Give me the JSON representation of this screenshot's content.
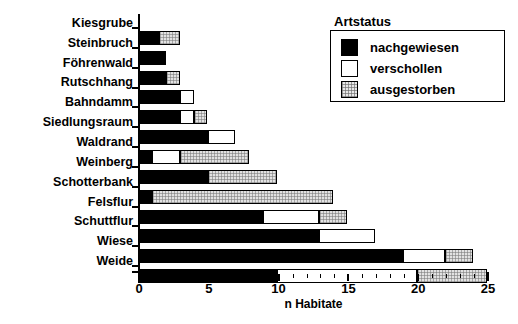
{
  "chart_data": {
    "type": "bar",
    "orientation": "horizontal",
    "stacked": true,
    "title": "",
    "xlabel": "n Habitate",
    "ylabel": "",
    "xlim": [
      0,
      25
    ],
    "xticks": [
      0,
      5,
      10,
      15,
      20,
      25
    ],
    "xticklabels": [
      "0",
      "5",
      "10",
      "15",
      "20",
      "25"
    ],
    "minor_tick_step": 1,
    "grid": false,
    "categories": [
      "Kiesgrube",
      "Steinbruch",
      "Föhrenwald",
      "Rutschhang",
      "Bahndamm",
      "Siedlungsraum",
      "Waldrand",
      "Weinberg",
      "Schotterbank",
      "Felsflur",
      "Schuttflur",
      "Wiese",
      "Weide"
    ],
    "series": [
      {
        "name": "nachgewiesen",
        "color": "#000000",
        "values": [
          1.5,
          2,
          2,
          3,
          3,
          5,
          1,
          5,
          1,
          9,
          13,
          19,
          10
        ]
      },
      {
        "name": "verschollen",
        "color": "#ffffff",
        "values": [
          0,
          0,
          0,
          1,
          1,
          2,
          2,
          0,
          0,
          4,
          4,
          3,
          10
        ]
      },
      {
        "name": "ausgestorben",
        "color": "#e2e2e2",
        "values": [
          1.5,
          0,
          1,
          0,
          1,
          0,
          5,
          5,
          13,
          2,
          0,
          2,
          5
        ]
      }
    ],
    "totals": [
      3,
      2,
      3,
      4,
      5,
      7,
      8,
      10,
      14,
      15,
      17,
      24,
      25
    ],
    "legend": {
      "title": "Artstatus",
      "position": "upper right",
      "entries": [
        "nachgewiesen",
        "verschollen",
        "ausgestorben"
      ]
    }
  },
  "legend": {
    "title": "Artstatus",
    "items": [
      {
        "label": "nachgewiesen",
        "swatch": "solid-black-swatch"
      },
      {
        "label": "verschollen",
        "swatch": "empty-white-swatch"
      },
      {
        "label": "ausgestorben",
        "swatch": "hatched-gray-swatch"
      }
    ]
  },
  "axis": {
    "x_title": "n Habitate",
    "x_labels": [
      "0",
      "5",
      "10",
      "15",
      "20",
      "25"
    ]
  }
}
